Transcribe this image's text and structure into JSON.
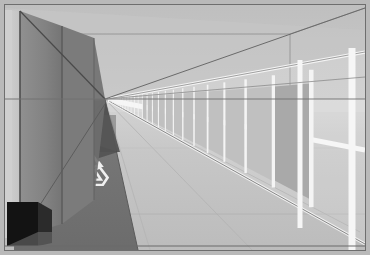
{
  "scene": {
    "title": "Architectural perspective corridor render",
    "subject": "pedestrian walkway with recycling floor marking",
    "projection": "one-point perspective",
    "vanishing_point": {
      "x": 105,
      "y": 99
    },
    "canvas": {
      "width": 370,
      "height": 255
    },
    "image_border": {
      "label": "image-border",
      "color": "#6e6e6e",
      "outer_color": "#b9b9b9",
      "width_px": 1,
      "inset_px": 4
    },
    "palette": {
      "sky": "#c9c9c9",
      "sky_low": "#d7d7d7",
      "ceiling_soffit": "#c2c2c2",
      "floor_light": "#c6c6c6",
      "floor_mid": "#bdbdbd",
      "floor_far": "#d2d2d2",
      "walkway_dark": "#6f6f6f",
      "walkway_dark2": "#777777",
      "wall_left_face": "#8a8a8a",
      "wall_left_panel": "#7c7c7c",
      "wall_left_light": "#c8c8c8",
      "wall_left_edge": "#cfcfcf",
      "shadow_triangle": "#545454",
      "shadow_soft": "#636363",
      "recess_black": "#151515",
      "rail_white": "#f4f4f4",
      "rail_panel": "#a9a9a9",
      "rail_panel_far": "#c0c0c0",
      "line_dark": "#5a5a5a",
      "line_mid": "#8f8f8f",
      "recycle_symbol": "#f2f2f2"
    },
    "elements": {
      "sky_label": "sky-backdrop",
      "ceiling_label": "ceiling-soffit",
      "floor_label": "floor-plane",
      "walkway_label": "walkway-strip",
      "left_wall_label": "left-wall",
      "left_recess_label": "left-wall-recess",
      "right_railing_label": "right-railing",
      "recycle_label": "recycling-floor-marking",
      "shadow_label": "cast-shadow",
      "horizon_label": "horizon-line"
    },
    "left_wall": {
      "panel_count": 3,
      "near_top_y": 12,
      "near_bottom_y": 232,
      "far_x": 105
    },
    "right_railing": {
      "baluster_count": 26,
      "top_rail_near_y": 62,
      "top_rail_far_y": 99,
      "bottom_rail_near_y": 236,
      "bottom_rail_far_y": 101,
      "near_x": 366,
      "far_x": 108,
      "rail_color": "#f4f4f4",
      "gap_color": "#a9a9a9"
    },
    "recycling_mark": {
      "name": "recycling-symbol",
      "arrow_count": 3,
      "center_x": 87,
      "center_y": 171,
      "radius": 22,
      "color": "#f2f2f2",
      "description": "three chasing arrows Mobius loop painted on dark walkway"
    }
  }
}
